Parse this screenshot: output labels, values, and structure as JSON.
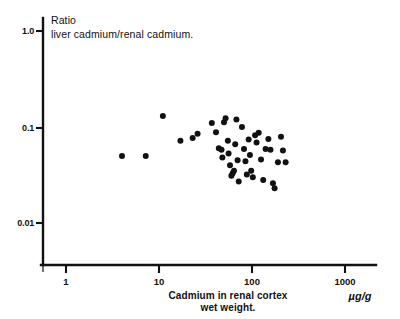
{
  "figure": {
    "background_color": "#ffffff",
    "ink_color": "#111111"
  },
  "chart_data": {
    "type": "scatter",
    "title": "",
    "y_axis_title_line1": "Ratio",
    "y_axis_title_line2": "liver cadmium/renal cadmium.",
    "xlabel_line1": "Cadmium in renal cortex",
    "xlabel_line2": "wet weight.",
    "xlabel_units": "µg/g",
    "ylabel": "Ratio liver cadmium/renal cadmium.",
    "xscale": "log",
    "yscale": "log",
    "xlim": [
      0.55,
      2200
    ],
    "ylim": [
      0.0072,
      1.6
    ],
    "xticks": [
      1,
      10,
      100,
      1000
    ],
    "xtick_labels": [
      "1",
      "10",
      "100",
      "1000"
    ],
    "yticks": [
      1.0,
      0.1,
      0.01
    ],
    "ytick_labels": [
      "1.0",
      "0.1",
      "0.01"
    ],
    "grid": false,
    "legend": false,
    "marker": "filled-circle",
    "marker_color": "#111111",
    "n_points": 45,
    "points": [
      {
        "x": 4.0,
        "y": 0.05
      },
      {
        "x": 7.2,
        "y": 0.05
      },
      {
        "x": 11.0,
        "y": 0.13
      },
      {
        "x": 17.0,
        "y": 0.072
      },
      {
        "x": 23.0,
        "y": 0.077
      },
      {
        "x": 26.0,
        "y": 0.085
      },
      {
        "x": 37.0,
        "y": 0.11
      },
      {
        "x": 41.0,
        "y": 0.088
      },
      {
        "x": 44.0,
        "y": 0.06
      },
      {
        "x": 47.0,
        "y": 0.058
      },
      {
        "x": 48.0,
        "y": 0.048
      },
      {
        "x": 50.0,
        "y": 0.112
      },
      {
        "x": 52.0,
        "y": 0.123
      },
      {
        "x": 55.0,
        "y": 0.072
      },
      {
        "x": 56.0,
        "y": 0.053
      },
      {
        "x": 58.0,
        "y": 0.04
      },
      {
        "x": 60.0,
        "y": 0.031
      },
      {
        "x": 62.0,
        "y": 0.033
      },
      {
        "x": 64.0,
        "y": 0.035
      },
      {
        "x": 66.0,
        "y": 0.066
      },
      {
        "x": 68.0,
        "y": 0.12
      },
      {
        "x": 70.0,
        "y": 0.045
      },
      {
        "x": 72.0,
        "y": 0.027
      },
      {
        "x": 78.0,
        "y": 0.1
      },
      {
        "x": 82.0,
        "y": 0.059
      },
      {
        "x": 85.0,
        "y": 0.044
      },
      {
        "x": 88.0,
        "y": 0.032
      },
      {
        "x": 92.0,
        "y": 0.074
      },
      {
        "x": 95.0,
        "y": 0.051
      },
      {
        "x": 98.0,
        "y": 0.035
      },
      {
        "x": 102.0,
        "y": 0.03
      },
      {
        "x": 108.0,
        "y": 0.082
      },
      {
        "x": 112.0,
        "y": 0.069
      },
      {
        "x": 118.0,
        "y": 0.087
      },
      {
        "x": 125.0,
        "y": 0.046
      },
      {
        "x": 132.0,
        "y": 0.028
      },
      {
        "x": 140.0,
        "y": 0.059
      },
      {
        "x": 150.0,
        "y": 0.075
      },
      {
        "x": 158.0,
        "y": 0.058
      },
      {
        "x": 168.0,
        "y": 0.026
      },
      {
        "x": 175.0,
        "y": 0.023
      },
      {
        "x": 190.0,
        "y": 0.043
      },
      {
        "x": 205.0,
        "y": 0.079
      },
      {
        "x": 215.0,
        "y": 0.057
      },
      {
        "x": 230.0,
        "y": 0.043
      }
    ]
  }
}
